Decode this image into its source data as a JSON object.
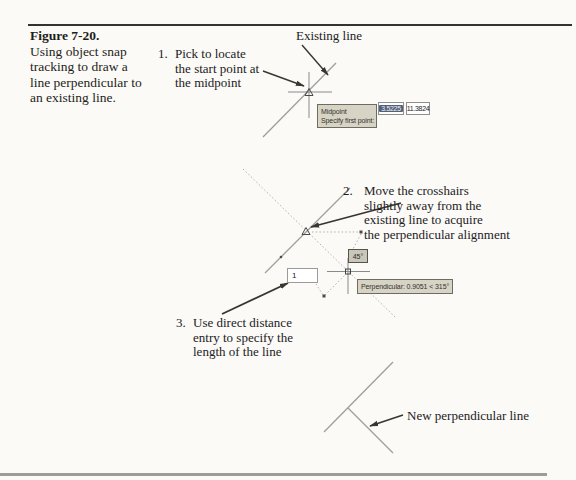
{
  "caption": {
    "title": "Figure 7-20.",
    "lines": [
      "Using object snap",
      "tracking to draw a",
      "line perpendicular to",
      "an existing line."
    ]
  },
  "labels": {
    "existing_line": "Existing line",
    "new_perpendicular_line": "New perpendicular line"
  },
  "steps": [
    {
      "number": "1.",
      "lines": [
        "Pick to locate",
        "the start point at",
        "the midpoint"
      ]
    },
    {
      "number": "2.",
      "lines": [
        "Move the crosshairs",
        "slightly away from the",
        "existing line to acquire",
        "the perpendicular alignment"
      ]
    },
    {
      "number": "3.",
      "lines": [
        "Use direct distance",
        "entry to specify the",
        "length of the line"
      ]
    }
  ],
  "autocad_ui": {
    "osnap_tooltip": {
      "line1": "Midpoint",
      "line2": "Specify first point:"
    },
    "coord_x_value": "3.5225",
    "coord_y_value": "11.3824",
    "angle_readout": "45°",
    "perpendicular_tooltip": "Perpendicular: 0.9051 < 315°",
    "distance_input_value": "1"
  },
  "colors": {
    "page_bg": "#fbfaf6",
    "tooltip_bg": "#d7d4c6",
    "tooltip_border": "#6e6c60",
    "selection_bg": "#51617c",
    "line_gray": "#9e9e9e",
    "dotted_gray": "#b3b3b3",
    "arrow_color": "#38362f"
  }
}
